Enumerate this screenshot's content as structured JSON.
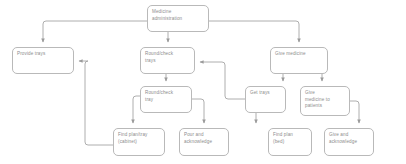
{
  "diagram": {
    "background_color": "#ffffff",
    "node_fill": "#ffffff",
    "node_border_color": "#b9b9b9",
    "edge_color": "#9a9a9a",
    "text_color": "#8d8d8d",
    "nodes": [
      {
        "id": "medicine_administration",
        "label": "Medicine administration",
        "lines": [
          "Medicine",
          "administration"
        ],
        "x": 147,
        "y": 5,
        "w": 62,
        "h": 27
      },
      {
        "id": "provide_trays",
        "label": "Provide trays",
        "lines": [
          "Provide trays"
        ],
        "x": 12,
        "y": 47,
        "w": 62,
        "h": 27
      },
      {
        "id": "round_check_trays",
        "label": "Round/check trays",
        "lines": [
          "Round/check",
          "trays"
        ],
        "x": 140,
        "y": 47,
        "w": 55,
        "h": 27
      },
      {
        "id": "give_medicine",
        "label": "Give medicine",
        "lines": [
          "Give medicine"
        ],
        "x": 270,
        "y": 47,
        "w": 58,
        "h": 27
      },
      {
        "id": "round_check_tray",
        "label": "Round/check tray",
        "lines": [
          "Round/check",
          "tray"
        ],
        "x": 140,
        "y": 86,
        "w": 52,
        "h": 27
      },
      {
        "id": "get_trays",
        "label": "Get trays",
        "lines": [
          "Get trays"
        ],
        "x": 245,
        "y": 86,
        "w": 41,
        "h": 27
      },
      {
        "id": "give_medicine_to_patients",
        "label": "Give medicine to patients",
        "lines": [
          "Give",
          "medicine to",
          "patients"
        ],
        "x": 300,
        "y": 86,
        "w": 50,
        "h": 30
      },
      {
        "id": "find_plan_tray_cabinet",
        "label": "Find plan/tray (cabinet)",
        "lines": [
          "Find plan/tray",
          "(cabinet)"
        ],
        "x": 113,
        "y": 128,
        "w": 52,
        "h": 28
      },
      {
        "id": "pour_and_acknowledge",
        "label": "Pour and acknowledge",
        "lines": [
          "Pour and",
          "acknowledge"
        ],
        "x": 179,
        "y": 128,
        "w": 50,
        "h": 28
      },
      {
        "id": "find_plan_bed",
        "label": "Find plan (bed)",
        "lines": [
          "Find plan",
          "(bed)"
        ],
        "x": 268,
        "y": 128,
        "w": 44,
        "h": 28
      },
      {
        "id": "give_and_acknowledge",
        "label": "Give and acknowledge",
        "lines": [
          "Give and",
          "acknowledge"
        ],
        "x": 324,
        "y": 128,
        "w": 50,
        "h": 28
      }
    ],
    "edges": [
      {
        "id": "edge-root-to-provide-trays",
        "from": "medicine_administration",
        "to": "provide_trays"
      },
      {
        "id": "edge-root-to-round-check-trays",
        "from": "medicine_administration",
        "to": "round_check_trays"
      },
      {
        "id": "edge-root-to-give-medicine",
        "from": "medicine_administration",
        "to": "give_medicine"
      },
      {
        "id": "edge-round-check-trays-to-round-check-tray",
        "from": "round_check_trays",
        "to": "round_check_tray"
      },
      {
        "id": "edge-round-check-tray-to-find-plan-tray",
        "from": "round_check_tray",
        "to": "find_plan_tray_cabinet"
      },
      {
        "id": "edge-round-check-tray-to-pour-and-acknowledge",
        "from": "round_check_tray",
        "to": "pour_and_acknowledge"
      },
      {
        "id": "edge-find-plan-tray-to-provide-trays",
        "from": "find_plan_tray_cabinet",
        "to": "provide_trays"
      },
      {
        "id": "edge-give-medicine-to-get-trays",
        "from": "give_medicine",
        "to": "get_trays"
      },
      {
        "id": "edge-give-medicine-to-give-medicine-to-patients",
        "from": "give_medicine",
        "to": "give_medicine_to_patients"
      },
      {
        "id": "edge-get-trays-to-round-check-trays",
        "from": "get_trays",
        "to": "round_check_trays"
      },
      {
        "id": "edge-get-trays-to-find-plan-bed",
        "from": "get_trays",
        "to": "find_plan_bed"
      },
      {
        "id": "edge-give-medicine-to-patients-to-give-and-acknowledge",
        "from": "give_medicine_to_patients",
        "to": "give_and_acknowledge"
      }
    ]
  }
}
